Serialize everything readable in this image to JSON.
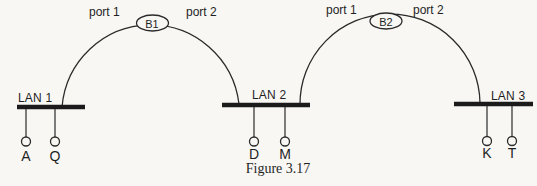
{
  "figure": {
    "caption": "Figure 3.17",
    "background_color": "#f8f7f4",
    "line_color": "#2a2a2a",
    "bar_color": "#1b1b1b"
  },
  "bridges": [
    {
      "label": "B1",
      "port1": "port 1",
      "port2": "port 2"
    },
    {
      "label": "B2",
      "port1": "port 1",
      "port2": "port 2"
    }
  ],
  "lans": [
    {
      "label": "LAN 1",
      "hosts": [
        "A",
        "Q"
      ]
    },
    {
      "label": "LAN 2",
      "hosts": [
        "D",
        "M"
      ]
    },
    {
      "label": "LAN 3",
      "hosts": [
        "K",
        "T"
      ]
    }
  ]
}
